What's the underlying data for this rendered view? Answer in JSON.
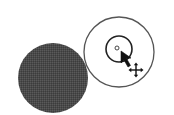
{
  "figure": {
    "colors": {
      "background": "#ffffff",
      "filled_circle": "#4a4a4a",
      "outline": "#333333",
      "cursor": "#111111"
    },
    "shapes": {
      "filled_circle": {
        "cx": 53,
        "cy": 78,
        "r": 35
      },
      "outer_ring": {
        "cx": 119,
        "cy": 52,
        "r": 35
      },
      "inner_ring": {
        "cx": 119,
        "cy": 49,
        "r": 13
      },
      "center_dot": {
        "cx": 117,
        "cy": 48,
        "r": 2
      }
    },
    "icons": {
      "pointer": "arrow-cursor-icon",
      "move": "move-cursor-icon"
    }
  }
}
